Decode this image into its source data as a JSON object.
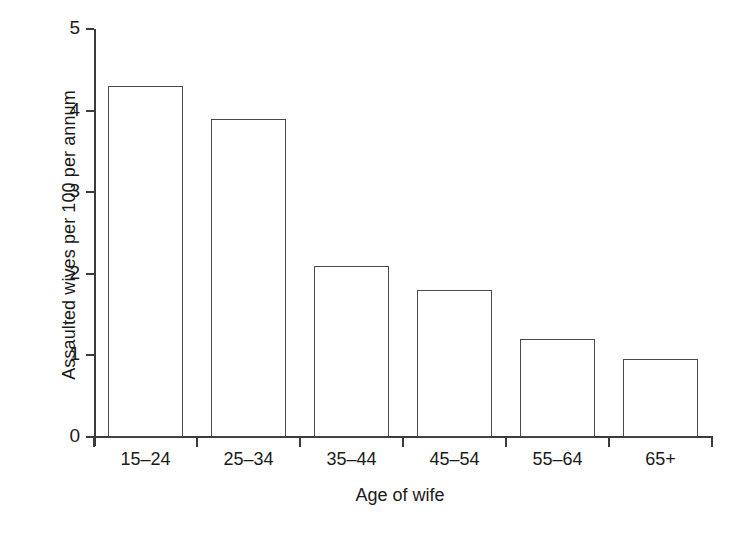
{
  "chart_data": {
    "type": "bar",
    "title": "",
    "xlabel": "Age of wife",
    "ylabel": "Assaulted wives per 100 per annum",
    "categories": [
      "15–24",
      "25–34",
      "35–44",
      "45–54",
      "55–64",
      "65+"
    ],
    "values": [
      4.3,
      3.9,
      2.1,
      1.8,
      1.2,
      0.95
    ],
    "ylim": [
      0,
      5
    ],
    "ytick_labels": [
      "5",
      "4",
      "3",
      "2",
      "1",
      "0"
    ],
    "ytick_values": [
      5,
      4,
      3,
      2,
      1,
      0
    ],
    "grid": false,
    "legend": false,
    "legend_position": "none",
    "bar_face_color": "#ffffff",
    "bar_edge_color": "#4a4a4a",
    "axis_color": "#3b3b3b",
    "background_color": "#ffffff"
  }
}
